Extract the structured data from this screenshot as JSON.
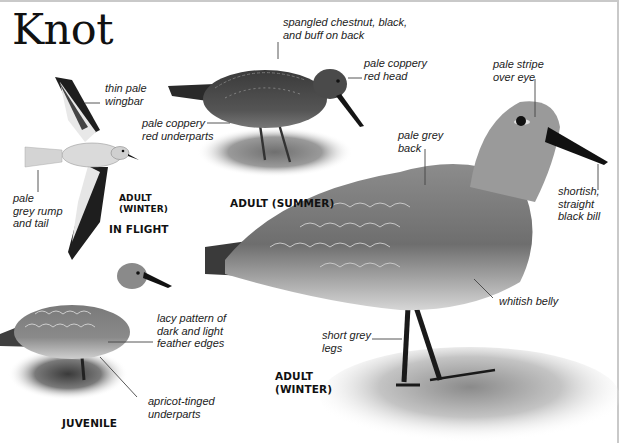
{
  "title": "Knot",
  "figures": [
    {
      "id": "in-flight",
      "caption_age": "ADULT\n(WINTER)",
      "caption_pose": "IN FLIGHT",
      "labels": [
        {
          "id": "wingbar",
          "text": "thin pale\nwingbar"
        },
        {
          "id": "rump",
          "text": "pale\ngrey rump\nand tail"
        }
      ]
    },
    {
      "id": "adult-summer",
      "caption": "ADULT (SUMMER)",
      "labels": [
        {
          "id": "back",
          "text": "spangled chestnut, black,\nand buff on back"
        },
        {
          "id": "head",
          "text": "pale coppery\nred head"
        },
        {
          "id": "underparts",
          "text": "pale coppery\nred underparts"
        }
      ]
    },
    {
      "id": "adult-winter",
      "caption": "ADULT\n(WINTER)",
      "labels": [
        {
          "id": "stripe",
          "text": "pale stripe\nover eye"
        },
        {
          "id": "back",
          "text": "pale grey\nback"
        },
        {
          "id": "bill",
          "text": "shortish,\nstraight\nblack bill"
        },
        {
          "id": "belly",
          "text": "whitish belly"
        },
        {
          "id": "legs",
          "text": "short grey\nlegs"
        }
      ]
    },
    {
      "id": "juvenile",
      "caption": "JUVENILE",
      "labels": [
        {
          "id": "lacy",
          "text": "lacy pattern of\ndark and light\nfeather edges"
        },
        {
          "id": "underparts",
          "text": "apricot-tinged\nunderparts"
        }
      ]
    }
  ]
}
